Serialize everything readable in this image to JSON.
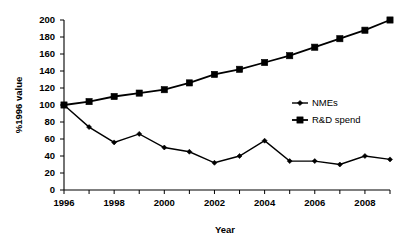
{
  "chart_data": {
    "type": "line",
    "title": "",
    "xlabel": "Year",
    "ylabel": "%1996 value",
    "x": [
      1996,
      1997,
      1998,
      1999,
      2000,
      2001,
      2002,
      2003,
      2004,
      2005,
      2006,
      2007,
      2008,
      2009
    ],
    "xtick_labels": [
      "1996",
      "",
      "1998",
      "",
      "2000",
      "",
      "2002",
      "",
      "2004",
      "",
      "2006",
      "",
      "2008",
      ""
    ],
    "xlim": [
      1996,
      2009
    ],
    "ylim": [
      0,
      200
    ],
    "ytick_labels": [
      "0",
      "20",
      "40",
      "60",
      "80",
      "100",
      "120",
      "140",
      "160",
      "180",
      "200"
    ],
    "yticks": [
      0,
      20,
      40,
      60,
      80,
      100,
      120,
      140,
      160,
      180,
      200
    ],
    "grid": false,
    "legend_position": "center-right",
    "series": [
      {
        "name": "NMEs",
        "marker": "diamond",
        "color": "#000000",
        "values": [
          100,
          74,
          56,
          66,
          50,
          45,
          32,
          40,
          58,
          34,
          34,
          30,
          40,
          36
        ]
      },
      {
        "name": "R&D spend",
        "marker": "square",
        "color": "#000000",
        "values": [
          100,
          104,
          110,
          114,
          118,
          126,
          136,
          142,
          150,
          158,
          168,
          178,
          188,
          200
        ]
      }
    ]
  },
  "legend": {
    "items": [
      {
        "label": "NMEs"
      },
      {
        "label": "R&D spend"
      }
    ]
  },
  "axes": {
    "y_title": "%1996 value",
    "x_title": "Year"
  }
}
